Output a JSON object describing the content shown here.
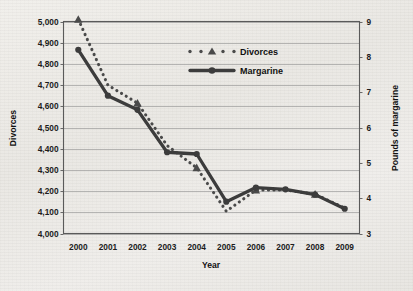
{
  "chart_data": {
    "type": "line",
    "title": "",
    "xlabel": "Year",
    "categories": [
      "2000",
      "2001",
      "2002",
      "2003",
      "2004",
      "2005",
      "2006",
      "2007",
      "2008",
      "2009"
    ],
    "grid": true,
    "legend_position": "top-center",
    "series": [
      {
        "name": "Divorces",
        "axis": "left",
        "ylabel": "Divorces",
        "ylim": [
          4000,
          5000
        ],
        "ytick_labels": [
          "4,000",
          "4,100",
          "4,200",
          "4,300",
          "4,400",
          "4,500",
          "4,600",
          "4,700",
          "4,800",
          "4,900",
          "5,000"
        ],
        "yticks": [
          4000,
          4100,
          4200,
          4300,
          4400,
          4500,
          4600,
          4700,
          4800,
          4900,
          5000
        ],
        "values": [
          5010,
          4700,
          4615,
          4415,
          4310,
          4105,
          4205,
          4205,
          4185,
          4120
        ],
        "marker": "triangle",
        "linestyle": "dotted",
        "color": "#4a4a4a"
      },
      {
        "name": "Margarine",
        "axis": "right",
        "ylabel": "Pounds of margarine",
        "ylim": [
          3,
          9
        ],
        "ytick_labels": [
          "3",
          "4",
          "5",
          "6",
          "7",
          "8",
          "9"
        ],
        "yticks": [
          3,
          4,
          5,
          6,
          7,
          8,
          9
        ],
        "values": [
          8.2,
          6.9,
          6.5,
          5.3,
          5.25,
          3.9,
          4.3,
          4.25,
          4.1,
          3.7
        ],
        "marker": "circle",
        "linestyle": "solid",
        "color": "#3c3c3c"
      }
    ]
  },
  "legend": {
    "items": [
      {
        "label": "Divorces",
        "style": "dotted-triangle"
      },
      {
        "label": "Margarine",
        "style": "solid-circle"
      }
    ]
  },
  "axes": {
    "left_title": "Divorces",
    "right_title": "Pounds of margarine",
    "bottom_title": "Year"
  },
  "colors": {
    "background": "#eceae6",
    "gridline": "#8f8f8f",
    "frame": "#5a5a5a",
    "ink": "#3c3c3c"
  }
}
